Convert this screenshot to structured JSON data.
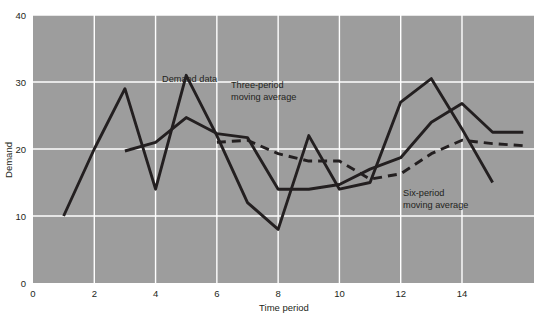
{
  "chart_data": {
    "type": "line",
    "title": "",
    "xlabel": "Time period",
    "ylabel": "Demand",
    "xlim": [
      0,
      16.35
    ],
    "ylim": [
      0,
      40
    ],
    "xticks": [
      0,
      2,
      4,
      6,
      8,
      10,
      12,
      14
    ],
    "yticks": [
      0,
      10,
      20,
      30,
      40
    ],
    "grid": true,
    "legend_position": "inline-annotations",
    "plot_background": "#9d9d9d",
    "gridline_color": "#ffffff",
    "line_color": "#231f20",
    "series": [
      {
        "name": "Demand data",
        "style": "solid",
        "x": [
          1,
          2,
          3,
          4,
          5,
          6,
          7,
          8,
          9,
          10,
          11,
          12,
          13,
          14,
          15
        ],
        "values": [
          10,
          20,
          29,
          14,
          31,
          22,
          12,
          8,
          22,
          14,
          15,
          27,
          30.5,
          23,
          15
        ]
      },
      {
        "name": "Three-period moving average",
        "style": "solid",
        "x": [
          3,
          4,
          5,
          6,
          7,
          8,
          9,
          10,
          11,
          12,
          13,
          14,
          15,
          16
        ],
        "values": [
          19.7,
          21,
          24.7,
          22.3,
          21.7,
          14,
          14,
          14.7,
          17,
          18.7,
          24,
          26.8,
          22.5,
          22.5
        ]
      },
      {
        "name": "Six-period moving average",
        "style": "dashed",
        "x": [
          6,
          7,
          8,
          9,
          10,
          11,
          12,
          13,
          14,
          15,
          16
        ],
        "values": [
          21,
          21.3,
          19.3,
          18.2,
          18.2,
          15.5,
          16.3,
          19.3,
          21.3,
          20.8,
          20.5
        ]
      }
    ],
    "annotations": [
      {
        "id": "demand-data",
        "text": "Demand data",
        "line1": "Demand data",
        "line2": "",
        "x": 162,
        "y": 82
      },
      {
        "id": "three-period",
        "text": "Three-period moving average",
        "line1": "Three-period",
        "line2": "moving average",
        "x": 231,
        "y": 88
      },
      {
        "id": "six-period",
        "text": "Six-period moving average",
        "line1": "Six-period",
        "line2": "moving average",
        "x": 403,
        "y": 196
      }
    ]
  },
  "axes": {
    "y_tick_labels": [
      "40",
      "30",
      "20",
      "10",
      "0"
    ],
    "x_tick_labels": [
      "0",
      "2",
      "4",
      "6",
      "8",
      "10",
      "12",
      "14"
    ],
    "x_title": "Time period",
    "y_title": "Demand"
  }
}
